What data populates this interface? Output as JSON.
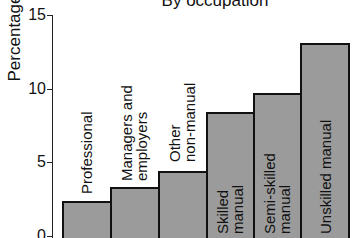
{
  "chart_data": {
    "type": "bar",
    "title": "By occupation",
    "xlabel": "",
    "ylabel": "Percentage",
    "ylim": [
      0,
      15
    ],
    "yticks": [
      0,
      5,
      10,
      15
    ],
    "grid": false,
    "legend": null,
    "categories": [
      "Professional",
      "Managers and employers",
      "Other non-manual",
      "Skilled manual",
      "Semi-skilled manual",
      "Unskilled manual"
    ],
    "category_label_lines": [
      [
        "Professional"
      ],
      [
        "Managers and",
        "employers"
      ],
      [
        "Other",
        "non-manual"
      ],
      [
        "Skilled",
        "manual"
      ],
      [
        "Semi-skilled",
        "manual"
      ],
      [
        "Unskilled manual"
      ]
    ],
    "values": [
      2.4,
      3.3,
      4.4,
      8.4,
      9.7,
      13.1
    ],
    "bar_color": "#9b9b9b",
    "edge_color": "#111111"
  }
}
